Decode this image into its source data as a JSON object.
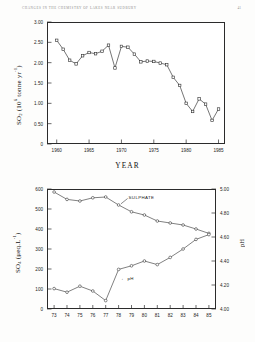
{
  "running_head": {
    "title": "CHANGES IN THE CHEMISTRY OF LAKES NEAR SUDBURY",
    "page_number": "41"
  },
  "chart_data": [
    {
      "id": "so2-emissions",
      "type": "line",
      "title": "",
      "xlabel": "YEAR",
      "ylabel": "SO2 (106 tonne yr-1)",
      "ylabel_parts": {
        "species": "SO",
        "species_sub": "2",
        "unit_open": " (10",
        "unit_exp": "6",
        "unit_rest": " tonne yr",
        "unit_exp2": "-1",
        "unit_close": ")"
      },
      "xlim": [
        1958.5,
        1986.0
      ],
      "ylim": [
        0,
        3.0
      ],
      "ytick_labels": [
        "0",
        "0.50",
        "1.00",
        "1.50",
        "2.00",
        "2.50",
        "3.00"
      ],
      "ytick_values": [
        0,
        0.5,
        1.0,
        1.5,
        2.0,
        2.5,
        3.0
      ],
      "xtick_labels": [
        "1960",
        "1965",
        "1970",
        "1975",
        "1980",
        "1985"
      ],
      "xtick_values": [
        1960,
        1965,
        1970,
        1975,
        1980,
        1985
      ],
      "grid": false,
      "legend": "none",
      "marker": "open-square",
      "x": [
        1960,
        1961,
        1962,
        1963,
        1964,
        1965,
        1966,
        1967,
        1968,
        1969,
        1970,
        1971,
        1972,
        1973,
        1974,
        1975,
        1976,
        1977,
        1978,
        1979,
        1980,
        1981,
        1982,
        1983,
        1984,
        1985
      ],
      "values": [
        2.55,
        2.33,
        2.06,
        1.97,
        2.17,
        2.25,
        2.22,
        2.28,
        2.43,
        1.87,
        2.4,
        2.38,
        2.21,
        2.02,
        2.04,
        2.03,
        1.99,
        1.95,
        1.64,
        1.44,
        1.0,
        0.8,
        1.11,
        0.98,
        0.58,
        0.86
      ]
    },
    {
      "id": "sulphate-ph",
      "type": "line",
      "title": "",
      "xlabel": "",
      "ylabel_left": "SO4 (ueq.L-1)",
      "ylabel_left_parts": {
        "species": "SO",
        "species_sub": "4",
        "unit_open": " (",
        "unit_mu": "μ",
        "unit_rest": "eq.L",
        "unit_exp": "-1",
        "unit_close": ")"
      },
      "ylabel_right": "pH",
      "ylim_left": [
        0,
        600
      ],
      "ylim_right": [
        4.0,
        5.0
      ],
      "ytick_left_labels": [
        "0",
        "100",
        "200",
        "300",
        "400",
        "500",
        "600"
      ],
      "ytick_left_values": [
        0,
        100,
        200,
        300,
        400,
        500,
        600
      ],
      "ytick_right_labels": [
        "4.00",
        "4.20",
        "4.40",
        "4.60",
        "4.80",
        "5.00"
      ],
      "ytick_right_values": [
        4.0,
        4.2,
        4.4,
        4.6,
        4.8,
        5.0
      ],
      "xtick_labels": [
        "73",
        "74",
        "75",
        "76",
        "77",
        "78",
        "79",
        "80",
        "81",
        "82",
        "83",
        "84",
        "85"
      ],
      "xtick_values": [
        73,
        74,
        75,
        76,
        77,
        78,
        79,
        80,
        81,
        82,
        83,
        84,
        85
      ],
      "grid": false,
      "marker": "open-circle",
      "annotations": [
        {
          "text": "SULPHATE",
          "for": "sulphate"
        },
        {
          "text": "pH",
          "for": "ph",
          "arrow": "←"
        }
      ],
      "series": [
        {
          "name": "SULPHATE",
          "axis": "left",
          "x": [
            73,
            74,
            75,
            76,
            77,
            78,
            79,
            80,
            81,
            82,
            83,
            84,
            85
          ],
          "values": [
            585,
            548,
            540,
            556,
            560,
            520,
            486,
            470,
            440,
            430,
            420,
            400,
            378
          ]
        },
        {
          "name": "pH",
          "axis": "right",
          "x": [
            73,
            74,
            75,
            76,
            77,
            78,
            79,
            80,
            81,
            82,
            83,
            84,
            85
          ],
          "values": [
            4.17,
            4.14,
            4.19,
            4.15,
            4.07,
            4.33,
            4.36,
            4.4,
            4.37,
            4.43,
            4.5,
            4.58,
            4.62
          ]
        }
      ]
    }
  ]
}
